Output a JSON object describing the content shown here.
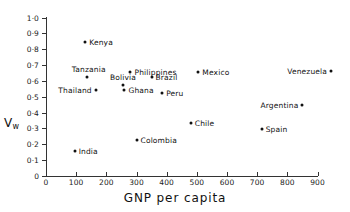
{
  "chart_data": {
    "type": "scatter",
    "title": "",
    "xlabel": "GNP per capita",
    "ylabel": "Vw",
    "ylabel_base": "V",
    "ylabel_sub": "w",
    "xlim": [
      0,
      900
    ],
    "ylim": [
      0,
      1.0
    ],
    "grid": false,
    "legend": "none",
    "xticks": [
      0,
      100,
      200,
      300,
      400,
      500,
      600,
      700,
      800,
      900
    ],
    "xtick_labels": [
      "0",
      "100",
      "200",
      "300",
      "400",
      "500",
      "600",
      "700",
      "800",
      "900"
    ],
    "yticks": [
      0,
      0.1,
      0.2,
      0.3,
      0.4,
      0.5,
      0.6,
      0.7,
      0.8,
      0.9,
      1.0
    ],
    "ytick_labels": [
      "0",
      "0·1",
      "0·2",
      "0·3",
      "0·4",
      "0·5",
      "0·6",
      "0·7",
      "0·8",
      "0·9",
      "1·0"
    ],
    "points": [
      {
        "label": "Kenya",
        "x": 130,
        "y": 0.845,
        "label_side": "right"
      },
      {
        "label": "Tanzania",
        "x": 135,
        "y": 0.625,
        "label_side": "above-left"
      },
      {
        "label": "Philippines",
        "x": 280,
        "y": 0.655,
        "label_side": "right"
      },
      {
        "label": "Brazil",
        "x": 350,
        "y": 0.625,
        "label_side": "right"
      },
      {
        "label": "Bolivia",
        "x": 255,
        "y": 0.575,
        "label_side": "above"
      },
      {
        "label": "Thailand",
        "x": 165,
        "y": 0.545,
        "label_side": "left"
      },
      {
        "label": "Ghana",
        "x": 260,
        "y": 0.545,
        "label_side": "right"
      },
      {
        "label": "Peru",
        "x": 385,
        "y": 0.525,
        "label_side": "right"
      },
      {
        "label": "Mexico",
        "x": 505,
        "y": 0.655,
        "label_side": "right"
      },
      {
        "label": "Venezuela",
        "x": 945,
        "y": 0.665,
        "label_side": "left"
      },
      {
        "label": "Argentina",
        "x": 850,
        "y": 0.445,
        "label_side": "left"
      },
      {
        "label": "Chile",
        "x": 480,
        "y": 0.335,
        "label_side": "right"
      },
      {
        "label": "Spain",
        "x": 715,
        "y": 0.295,
        "label_side": "right"
      },
      {
        "label": "Colombia",
        "x": 300,
        "y": 0.225,
        "label_side": "right"
      },
      {
        "label": "India",
        "x": 95,
        "y": 0.155,
        "label_side": "right"
      }
    ]
  },
  "colors": {
    "axis": "#333333",
    "marker": "#111111",
    "text": "#111111",
    "background": "#ffffff"
  }
}
